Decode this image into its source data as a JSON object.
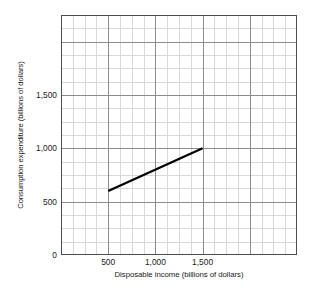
{
  "chart_data": {
    "type": "line",
    "title": "",
    "xlabel": "Disposable income (billions of dollars)",
    "ylabel": "Consumption expenditure (billions of dollars)",
    "xlim": [
      0,
      2500
    ],
    "ylim": [
      0,
      2250
    ],
    "grid": true,
    "legend": "none",
    "x_ticks": [
      {
        "value": 500,
        "label": "500"
      },
      {
        "value": 1000,
        "label": "1,000"
      },
      {
        "value": 1500,
        "label": "1,500"
      }
    ],
    "y_ticks": [
      {
        "value": 0,
        "label": "0"
      },
      {
        "value": 500,
        "label": "500"
      },
      {
        "value": 1000,
        "label": "1,000"
      },
      {
        "value": 1500,
        "label": "1,500"
      }
    ],
    "x_major_step": 500,
    "x_minor_step": 125,
    "y_major_step": 500,
    "y_minor_step": 125,
    "series": [
      {
        "name": "Consumption function",
        "color": "#000000",
        "x": [
          500,
          1500
        ],
        "values": [
          600,
          1000
        ],
        "style": "solid",
        "width": 2.2
      }
    ],
    "colors": {
      "axis": "#4d4d4d",
      "grid_major": "#8c8c8c",
      "grid_minor": "#d8d8d8",
      "line": "#000000",
      "text": "#1a1a1a",
      "background": "#ffffff"
    }
  }
}
